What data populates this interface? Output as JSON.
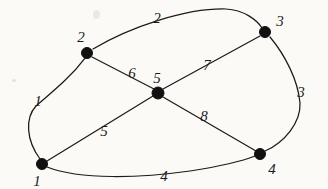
{
  "figure": {
    "kind": "undirected-weighted-graph-diagram",
    "background_color": "#fbfaf7",
    "ink_color": "#1b1b1b",
    "width": 328,
    "height": 189
  },
  "nodes": [
    {
      "id": "n1",
      "label": "1",
      "x": 42,
      "y": 164,
      "label_x": 37,
      "label_y": 181,
      "radius": 5.5
    },
    {
      "id": "n2",
      "label": "2",
      "x": 87,
      "y": 53,
      "label_x": 81,
      "label_y": 37,
      "radius": 5.5
    },
    {
      "id": "n3",
      "label": "3",
      "x": 265,
      "y": 32,
      "label_x": 280,
      "label_y": 21,
      "radius": 5.5
    },
    {
      "id": "n4",
      "label": "4",
      "x": 260,
      "y": 154,
      "label_x": 272,
      "label_y": 169,
      "radius": 5.5
    },
    {
      "id": "n5",
      "label": "5",
      "x": 158,
      "y": 93,
      "label_x": 157,
      "label_y": 78,
      "radius": 6.0
    }
  ],
  "edges": [
    {
      "id": "e1",
      "label": "1",
      "from": "n1",
      "to": "n2",
      "shape": "curve",
      "label_x": 38,
      "label_y": 101
    },
    {
      "id": "e2",
      "label": "2",
      "from": "n2",
      "to": "n3",
      "shape": "curve",
      "label_x": 157,
      "label_y": 18
    },
    {
      "id": "e3",
      "label": "3",
      "from": "n3",
      "to": "n4",
      "shape": "curve",
      "label_x": 301,
      "label_y": 92
    },
    {
      "id": "e4",
      "label": "4",
      "from": "n1",
      "to": "n4",
      "shape": "curve",
      "label_x": 164,
      "label_y": 176
    },
    {
      "id": "e5",
      "label": "5",
      "from": "n1",
      "to": "n5",
      "shape": "line",
      "label_x": 104,
      "label_y": 131
    },
    {
      "id": "e6",
      "label": "6",
      "from": "n2",
      "to": "n5",
      "shape": "line",
      "label_x": 132,
      "label_y": 73
    },
    {
      "id": "e7",
      "label": "7",
      "from": "n5",
      "to": "n3",
      "shape": "line",
      "label_x": 207,
      "label_y": 65
    },
    {
      "id": "e8",
      "label": "8",
      "from": "n5",
      "to": "n4",
      "shape": "line",
      "label_x": 204,
      "label_y": 116
    }
  ]
}
